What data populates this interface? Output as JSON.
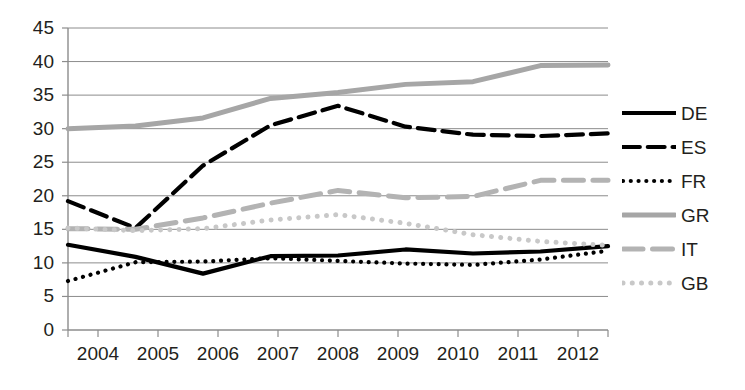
{
  "chart_data": {
    "type": "line",
    "title": "",
    "subtitle": "",
    "xlabel": "",
    "ylabel": "",
    "categories": [
      "2004",
      "2005",
      "2006",
      "2007",
      "2008",
      "2009",
      "2010",
      "2011",
      "2012"
    ],
    "x": [
      2004,
      2005,
      2006,
      2007,
      2008,
      2009,
      2010,
      2011,
      2012
    ],
    "ylim": [
      0,
      45
    ],
    "ytick_step": 5,
    "yticks": [
      0,
      5,
      10,
      15,
      20,
      25,
      30,
      35,
      40,
      45
    ],
    "grid": true,
    "grid_axis": "y",
    "legend_position": "right",
    "series": [
      {
        "name": "DE",
        "style": "solid",
        "color": "#000000",
        "width": 4.2,
        "values": [
          12.7,
          10.9,
          8.4,
          11.0,
          11.1,
          12.0,
          11.4,
          11.7,
          12.5
        ]
      },
      {
        "name": "ES",
        "style": "dashed",
        "color": "#000000",
        "width": 4.2,
        "values": [
          19.2,
          15.2,
          24.5,
          30.5,
          33.4,
          30.3,
          29.1,
          28.9,
          29.3
        ]
      },
      {
        "name": "FR",
        "style": "dotted",
        "color": "#000000",
        "width": 4.2,
        "values": [
          7.3,
          10.1,
          10.2,
          10.7,
          10.3,
          9.9,
          9.7,
          10.5,
          11.8
        ]
      },
      {
        "name": "GR",
        "style": "solid",
        "color": "#a6a6a6",
        "width": 5.0,
        "values": [
          30.0,
          30.4,
          31.6,
          34.5,
          35.4,
          36.6,
          37.0,
          39.4,
          39.5
        ]
      },
      {
        "name": "IT",
        "style": "dashed",
        "color": "#b3b3b3",
        "width": 5.0,
        "values": [
          15.1,
          15.0,
          16.7,
          18.9,
          20.8,
          19.7,
          19.9,
          22.3,
          22.3
        ]
      },
      {
        "name": "GB",
        "style": "dotted",
        "color": "#c8c8c8",
        "width": 5.0,
        "values": [
          15.2,
          14.8,
          15.1,
          16.4,
          17.2,
          15.9,
          14.2,
          13.2,
          12.6
        ]
      }
    ]
  },
  "legend": {
    "items": [
      {
        "label": "DE"
      },
      {
        "label": "ES"
      },
      {
        "label": "FR"
      },
      {
        "label": "GR"
      },
      {
        "label": "IT"
      },
      {
        "label": "GB"
      }
    ]
  }
}
